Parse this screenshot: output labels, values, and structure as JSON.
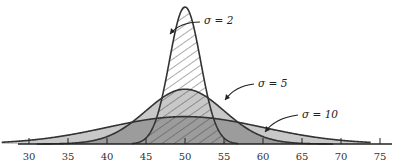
{
  "chart_data": {
    "type": "area",
    "title": "",
    "xlabel": "",
    "ylabel": "",
    "xlim": [
      30,
      75
    ],
    "x_ticks": [
      30,
      35,
      40,
      45,
      50,
      55,
      60,
      65,
      70,
      75
    ],
    "grid": false,
    "legend": "none (inline annotations)",
    "mean": 50,
    "series": [
      {
        "name": "σ = 2",
        "mean": 50,
        "sigma": 2,
        "fill": "hatched",
        "label_x": 260,
        "label_y": 20
      },
      {
        "name": "σ = 5",
        "mean": 50,
        "sigma": 5,
        "fill": "#c4c4c4",
        "label_x": 265,
        "label_y": 84
      },
      {
        "name": "σ = 10",
        "mean": 50,
        "sigma": 10,
        "fill": "#9a9a9a",
        "label_x": 300,
        "label_y": 116
      }
    ],
    "annotations": [
      {
        "text": "σ = 2",
        "arrow_to": [
          52,
          0.13
        ]
      },
      {
        "text": "σ = 5",
        "arrow_to": [
          56,
          0.04
        ]
      },
      {
        "text": "σ = 10",
        "arrow_to": [
          62,
          0.02
        ]
      }
    ]
  },
  "colors": {
    "curve_stroke": "#333333",
    "light_fill": "#c8c8c8",
    "dark_fill": "#9c9c9c",
    "hatch": "#444444",
    "axis": "#222222"
  }
}
